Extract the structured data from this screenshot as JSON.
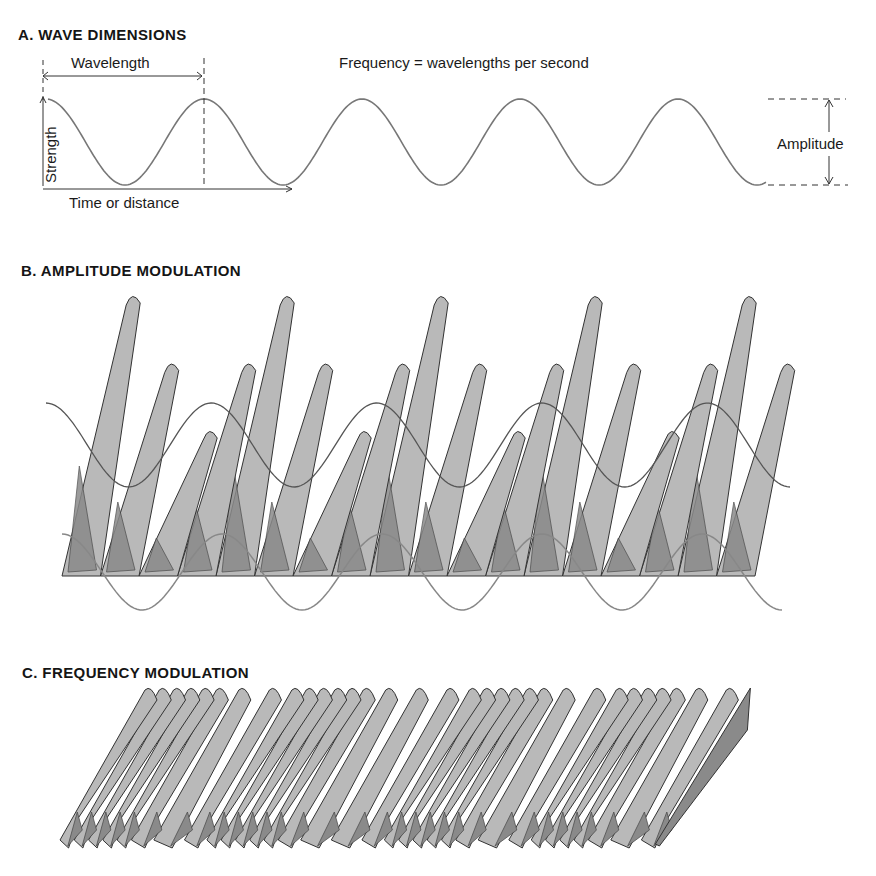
{
  "panels": {
    "a": {
      "title": "A.  WAVE DIMENSIONS",
      "wavelength_label": "Wavelength",
      "frequency_label": "Frequency = wavelengths per second",
      "strength_label": "Strength",
      "time_label": "Time or distance",
      "amplitude_label": "Amplitude",
      "cycles_shown": 4.6
    },
    "b": {
      "title": "B.  AMPLITUDE MODULATION",
      "carrier_ridges": 18,
      "envelope_cycles": 4.5
    },
    "c": {
      "title": "C.  FREQUENCY MODULATION",
      "ridges": 32,
      "pattern": "ridges bunch together (high frequency) then spread apart (low frequency), repeating"
    }
  },
  "colors": {
    "ink": "#3a3a3a",
    "line_gray": "#6e6e6e",
    "surface_light": "#b9b9b9",
    "surface_dark": "#8a8a8a",
    "background": "#ffffff"
  }
}
